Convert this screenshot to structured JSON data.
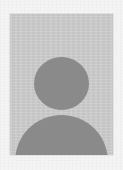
{
  "document": {
    "type": "scanned-form-photo-region",
    "width_px": 123,
    "height_px": 170,
    "paper_color": "#f4f4f4"
  },
  "artifacts": {
    "ghost_text_top_line_1": "· · · · · · · · · · · · · ·",
    "ghost_text_top_line_2": "· · · · · · · · · · ·",
    "ghost_text_bottom": "· · · · · · · · · · · · · · · ·",
    "note": "illegible scanner bleed-through"
  },
  "photo": {
    "alt_label": "photograph placeholder",
    "frame": {
      "x": 10,
      "y": 14,
      "width": 103,
      "height": 141
    },
    "background_color": "#cdcdcd",
    "silhouette_color": "#8a8a8a",
    "head": {
      "center_x": 61,
      "center_y": 83,
      "width": 55,
      "height": 53
    },
    "body": {
      "x": 15,
      "top_y": 115,
      "width": 93
    }
  }
}
